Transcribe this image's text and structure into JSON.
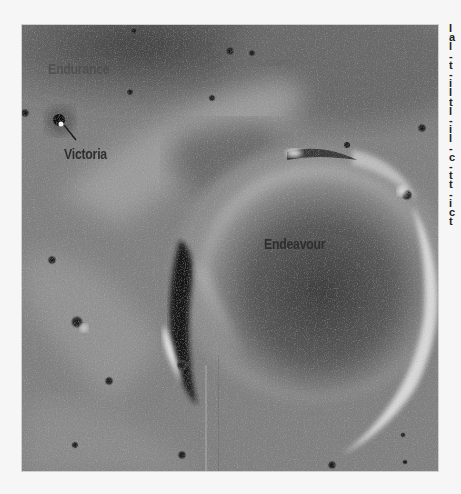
{
  "image": {
    "description": "Orbital grayscale view of Martian terrain with labeled craters",
    "colors": {
      "page_background": "#f6f6f6",
      "label_text": "#2e2e2e"
    }
  },
  "labels": [
    {
      "name": "endurance",
      "text": "Endurance"
    },
    {
      "name": "victoria",
      "text": "Victoria"
    },
    {
      "name": "endeavour",
      "text": "Endeavour"
    }
  ],
  "side_text_fragments": [
    "I",
    "a",
    "l",
    "-",
    "t",
    "-",
    "i",
    "l",
    "t",
    "l",
    "-",
    "i",
    "l",
    "-",
    "c",
    "-",
    "t",
    "t",
    "-",
    "i",
    "c",
    "t"
  ]
}
